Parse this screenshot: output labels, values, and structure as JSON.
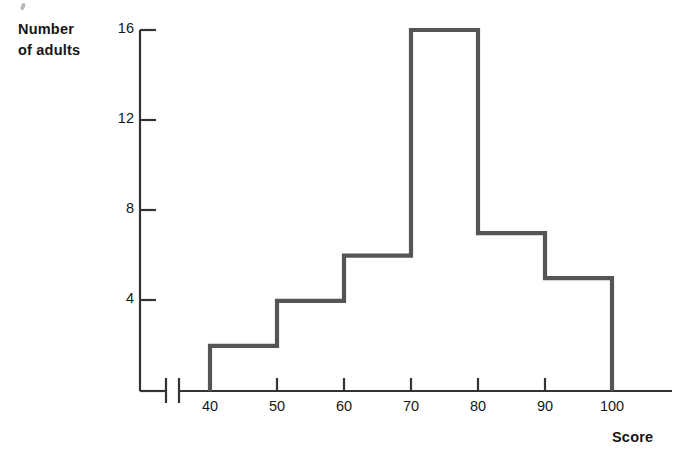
{
  "chart_data": {
    "type": "bar",
    "title": "",
    "subtitle": "",
    "xlabel": "Score",
    "ylabel": "Number\nof adults",
    "categories": [
      "40-50",
      "50-60",
      "60-70",
      "70-80",
      "80-90",
      "90-100"
    ],
    "bin_edges": [
      40,
      50,
      60,
      70,
      80,
      90,
      100
    ],
    "values": [
      2,
      4,
      6,
      16,
      7,
      5
    ],
    "x_tick_labels": [
      "40",
      "50",
      "60",
      "70",
      "80",
      "90",
      "100"
    ],
    "y_tick_labels": [
      "4",
      "8",
      "12",
      "16"
    ],
    "y_tick_values": [
      4,
      8,
      12,
      16
    ],
    "xlim": [
      40,
      100
    ],
    "ylim": [
      0,
      16
    ],
    "grid": false,
    "legend": null,
    "axis_break": true,
    "line_color": "#555555",
    "axis_color": "#333333",
    "fill": "none"
  },
  "labels": {
    "y_axis_title": "Number\nof adults",
    "x_axis_title": "Score"
  },
  "y_ticks": [
    {
      "label": "16"
    },
    {
      "label": "12"
    },
    {
      "label": "8"
    },
    {
      "label": "4"
    }
  ],
  "x_ticks": [
    {
      "label": "40"
    },
    {
      "label": "50"
    },
    {
      "label": "60"
    },
    {
      "label": "70"
    },
    {
      "label": "80"
    },
    {
      "label": "90"
    },
    {
      "label": "100"
    }
  ]
}
